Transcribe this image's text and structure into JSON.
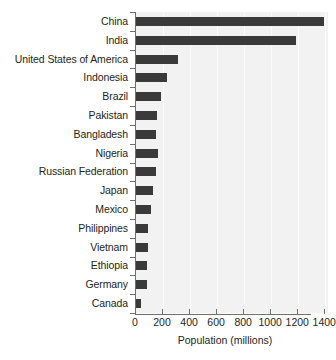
{
  "chart_data": {
    "type": "bar",
    "orientation": "horizontal",
    "title": "",
    "xlabel": "Population (millions)",
    "ylabel": "",
    "xlim": [
      0,
      1420
    ],
    "xticks": [
      0,
      200,
      400,
      600,
      800,
      1000,
      1200,
      1400
    ],
    "xtick_labels": [
      "0",
      "200",
      "400",
      "600",
      "800",
      "1000",
      "1200",
      "1400"
    ],
    "grid": true,
    "legend": false,
    "categories": [
      "China",
      "India",
      "United States of America",
      "Indonesia",
      "Brazil",
      "Pakistan",
      "Bangladesh",
      "Nigeria",
      "Russian Federation",
      "Japan",
      "Mexico",
      "Philippines",
      "Vietnam",
      "Ethiopia",
      "Germany",
      "Canada"
    ],
    "values": [
      1390,
      1180,
      310,
      228,
      188,
      157,
      150,
      160,
      150,
      127,
      114,
      92,
      90,
      80,
      80,
      36
    ]
  },
  "style": {
    "bar_color": "#3a3a3a",
    "plot_background": "#f2f2f2",
    "gridline_color": "#fbfbfb",
    "axis_color": "#6f6f6f",
    "text_color": "#231f20",
    "page_background": "#ffffff"
  }
}
